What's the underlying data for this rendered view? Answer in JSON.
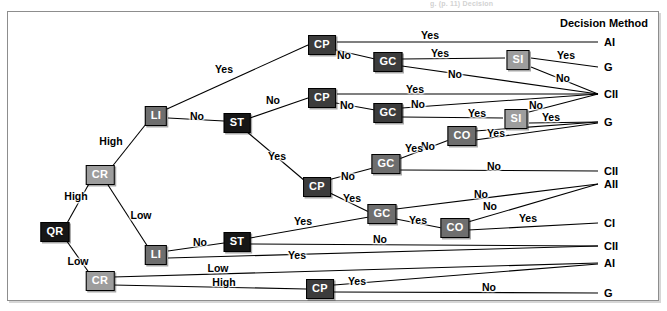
{
  "figure": {
    "cutoff_caption": "g. (p. 11) Decision",
    "header": {
      "label": "Decision Method",
      "x": 648,
      "y": 23
    },
    "frame": {
      "x": 7,
      "y": 11,
      "width": 650,
      "height": 288
    }
  },
  "palette": {
    "black": "#161616",
    "dark_gray": "#3c3c3c",
    "mid_gray": "#6e6e6e",
    "light_gray": "#9d9d9d",
    "line": "#000000",
    "background": "#ffffff",
    "frame_border": "#8d8d8d"
  },
  "nodes": [
    {
      "id": "QR",
      "label": "QR",
      "x": 55,
      "y": 232,
      "shade": "black"
    },
    {
      "id": "CR1",
      "label": "CR",
      "x": 100,
      "y": 175,
      "shade": "light_gray"
    },
    {
      "id": "CR2",
      "label": "CR",
      "x": 100,
      "y": 281,
      "shade": "light_gray"
    },
    {
      "id": "LI1",
      "label": "LI",
      "x": 156,
      "y": 116,
      "shade": "mid_gray"
    },
    {
      "id": "LI2",
      "label": "LI",
      "x": 156,
      "y": 255,
      "shade": "mid_gray"
    },
    {
      "id": "ST1",
      "label": "ST",
      "x": 237,
      "y": 123,
      "shade": "black"
    },
    {
      "id": "ST2",
      "label": "ST",
      "x": 237,
      "y": 242,
      "shade": "black"
    },
    {
      "id": "CP1",
      "label": "CP",
      "x": 322,
      "y": 45,
      "shade": "dark_gray"
    },
    {
      "id": "CP2",
      "label": "CP",
      "x": 322,
      "y": 98,
      "shade": "dark_gray"
    },
    {
      "id": "CP3",
      "label": "CP",
      "x": 317,
      "y": 187,
      "shade": "dark_gray"
    },
    {
      "id": "CP4",
      "label": "CP",
      "x": 320,
      "y": 289,
      "shade": "dark_gray"
    },
    {
      "id": "GC1",
      "label": "GC",
      "x": 388,
      "y": 62,
      "shade": "dark_gray"
    },
    {
      "id": "GC2",
      "label": "GC",
      "x": 388,
      "y": 113,
      "shade": "dark_gray"
    },
    {
      "id": "GC3",
      "label": "GC",
      "x": 386,
      "y": 164,
      "shade": "mid_gray"
    },
    {
      "id": "GC4",
      "label": "GC",
      "x": 382,
      "y": 214,
      "shade": "mid_gray"
    },
    {
      "id": "SI1",
      "label": "SI",
      "x": 518,
      "y": 60,
      "shade": "light_gray"
    },
    {
      "id": "SI2",
      "label": "SI",
      "x": 516,
      "y": 119,
      "shade": "light_gray"
    },
    {
      "id": "CO1",
      "label": "CO",
      "x": 462,
      "y": 136,
      "shade": "mid_gray"
    },
    {
      "id": "CO2",
      "label": "CO",
      "x": 455,
      "y": 228,
      "shade": "mid_gray"
    }
  ],
  "outcomes": [
    {
      "id": "o1",
      "label": "AI",
      "x": 604,
      "y": 42
    },
    {
      "id": "o2",
      "label": "G",
      "x": 604,
      "y": 67
    },
    {
      "id": "o3",
      "label": "CII",
      "x": 604,
      "y": 94
    },
    {
      "id": "o4",
      "label": "G",
      "x": 604,
      "y": 122
    },
    {
      "id": "o5",
      "label": "CII",
      "x": 604,
      "y": 171
    },
    {
      "id": "o6",
      "label": "AII",
      "x": 604,
      "y": 184
    },
    {
      "id": "o7",
      "label": "CI",
      "x": 604,
      "y": 223
    },
    {
      "id": "o8",
      "label": "CII",
      "x": 604,
      "y": 246
    },
    {
      "id": "o9",
      "label": "AI",
      "x": 604,
      "y": 263
    },
    {
      "id": "o10",
      "label": "G",
      "x": 604,
      "y": 293
    }
  ],
  "edges": [
    {
      "from": "QR",
      "to": "CR1",
      "x1": 66,
      "y1": 225,
      "x2": 90,
      "y2": 182
    },
    {
      "from": "QR",
      "to": "CR2",
      "x1": 66,
      "y1": 240,
      "x2": 90,
      "y2": 274
    },
    {
      "from": "CR1",
      "to": "LI1",
      "x1": 111,
      "y1": 168,
      "x2": 146,
      "y2": 124
    },
    {
      "from": "CR1",
      "to": "LI2",
      "x1": 108,
      "y1": 185,
      "x2": 148,
      "y2": 247
    },
    {
      "from": "LI1",
      "to": "CP1",
      "x1": 167,
      "y1": 109,
      "x2": 308,
      "y2": 45
    },
    {
      "from": "LI1",
      "to": "ST1",
      "x1": 168,
      "y1": 118,
      "x2": 224,
      "y2": 121
    },
    {
      "from": "ST1",
      "to": "CP2",
      "x1": 250,
      "y1": 118,
      "x2": 308,
      "y2": 98
    },
    {
      "from": "ST1",
      "to": "CP3",
      "x1": 246,
      "y1": 131,
      "x2": 305,
      "y2": 181
    },
    {
      "from": "CP1",
      "to": "o1",
      "x1": 337,
      "y1": 42,
      "x2": 598,
      "y2": 42
    },
    {
      "from": "CP1",
      "to": "GC1",
      "x1": 336,
      "y1": 50,
      "x2": 375,
      "y2": 59
    },
    {
      "from": "GC1",
      "to": "SI1",
      "x1": 402,
      "y1": 59,
      "x2": 505,
      "y2": 58
    },
    {
      "from": "GC1",
      "to": "o3",
      "x1": 402,
      "y1": 66,
      "x2": 598,
      "y2": 94
    },
    {
      "from": "SI1",
      "to": "o2",
      "x1": 531,
      "y1": 58,
      "x2": 598,
      "y2": 67
    },
    {
      "from": "SI1",
      "to": "o3",
      "x1": 531,
      "y1": 67,
      "x2": 598,
      "y2": 94
    },
    {
      "from": "CP2",
      "to": "o3",
      "x1": 337,
      "y1": 94,
      "x2": 598,
      "y2": 94
    },
    {
      "from": "CP2",
      "to": "GC2",
      "x1": 336,
      "y1": 103,
      "x2": 375,
      "y2": 110
    },
    {
      "from": "GC2",
      "to": "o3",
      "x1": 402,
      "y1": 108,
      "x2": 598,
      "y2": 94
    },
    {
      "from": "GC2",
      "to": "SI2",
      "x1": 402,
      "y1": 117,
      "x2": 503,
      "y2": 118
    },
    {
      "from": "SI2",
      "to": "o3",
      "x1": 529,
      "y1": 112,
      "x2": 598,
      "y2": 94
    },
    {
      "from": "SI2",
      "to": "o4",
      "x1": 529,
      "y1": 123,
      "x2": 598,
      "y2": 122
    },
    {
      "from": "CP3",
      "to": "GC3",
      "x1": 328,
      "y1": 180,
      "x2": 373,
      "y2": 168
    },
    {
      "from": "CP3",
      "to": "GC4",
      "x1": 330,
      "y1": 193,
      "x2": 369,
      "y2": 212
    },
    {
      "from": "GC3",
      "to": "CO1",
      "x1": 399,
      "y1": 159,
      "x2": 449,
      "y2": 140
    },
    {
      "from": "GC3",
      "to": "o5",
      "x1": 400,
      "y1": 170,
      "x2": 598,
      "y2": 171
    },
    {
      "from": "CO1",
      "to": "o4",
      "x1": 475,
      "y1": 131,
      "x2": 598,
      "y2": 122
    },
    {
      "from": "CO1",
      "to": "o4b",
      "x1": 475,
      "y1": 140,
      "x2": 598,
      "y2": 123
    },
    {
      "from": "GC4",
      "to": "o6",
      "x1": 396,
      "y1": 209,
      "x2": 598,
      "y2": 184
    },
    {
      "from": "GC4",
      "to": "CO2",
      "x1": 396,
      "y1": 219,
      "x2": 442,
      "y2": 228
    },
    {
      "from": "CO2",
      "to": "o6",
      "x1": 468,
      "y1": 222,
      "x2": 598,
      "y2": 184
    },
    {
      "from": "CO2",
      "to": "o7",
      "x1": 468,
      "y1": 230,
      "x2": 598,
      "y2": 223
    },
    {
      "from": "LI2",
      "to": "ST2",
      "x1": 168,
      "y1": 251,
      "x2": 224,
      "y2": 243
    },
    {
      "from": "LI2",
      "to": "o8",
      "x1": 168,
      "y1": 258,
      "x2": 598,
      "y2": 246
    },
    {
      "from": "ST2",
      "to": "GC4",
      "x1": 250,
      "y1": 238,
      "x2": 369,
      "y2": 217
    },
    {
      "from": "ST2",
      "to": "o8",
      "x1": 250,
      "y1": 244,
      "x2": 598,
      "y2": 246
    },
    {
      "from": "CR2",
      "to": "o9",
      "x1": 113,
      "y1": 277,
      "x2": 598,
      "y2": 263
    },
    {
      "from": "CR2",
      "to": "CP4",
      "x1": 113,
      "y1": 285,
      "x2": 306,
      "y2": 289
    },
    {
      "from": "CP4",
      "to": "o9",
      "x1": 334,
      "y1": 285,
      "x2": 598,
      "y2": 264
    },
    {
      "from": "CP4",
      "to": "o10",
      "x1": 334,
      "y1": 292,
      "x2": 598,
      "y2": 293
    }
  ],
  "edge_labels": [
    {
      "text": "High",
      "x": 76,
      "y": 196
    },
    {
      "text": "Low",
      "x": 78,
      "y": 261
    },
    {
      "text": "High",
      "x": 111,
      "y": 141
    },
    {
      "text": "Low",
      "x": 141,
      "y": 215
    },
    {
      "text": "Yes",
      "x": 224,
      "y": 69
    },
    {
      "text": "No",
      "x": 197,
      "y": 116
    },
    {
      "text": "No",
      "x": 273,
      "y": 100
    },
    {
      "text": "Yes",
      "x": 277,
      "y": 156
    },
    {
      "text": "Yes",
      "x": 430,
      "y": 35
    },
    {
      "text": "No",
      "x": 344,
      "y": 55
    },
    {
      "text": "Yes",
      "x": 440,
      "y": 53
    },
    {
      "text": "No",
      "x": 455,
      "y": 74
    },
    {
      "text": "Yes",
      "x": 566,
      "y": 55
    },
    {
      "text": "No",
      "x": 563,
      "y": 78
    },
    {
      "text": "Yes",
      "x": 415,
      "y": 89
    },
    {
      "text": "No",
      "x": 347,
      "y": 105
    },
    {
      "text": "No",
      "x": 418,
      "y": 104
    },
    {
      "text": "Yes",
      "x": 477,
      "y": 113
    },
    {
      "text": "No",
      "x": 536,
      "y": 105
    },
    {
      "text": "Yes",
      "x": 551,
      "y": 117
    },
    {
      "text": "Yes",
      "x": 496,
      "y": 133
    },
    {
      "text": "No",
      "x": 428,
      "y": 146
    },
    {
      "text": "Yes",
      "x": 414,
      "y": 148
    },
    {
      "text": "No",
      "x": 494,
      "y": 166
    },
    {
      "text": "No",
      "x": 348,
      "y": 176
    },
    {
      "text": "Yes",
      "x": 352,
      "y": 198
    },
    {
      "text": "No",
      "x": 481,
      "y": 194
    },
    {
      "text": "No",
      "x": 490,
      "y": 206
    },
    {
      "text": "Yes",
      "x": 418,
      "y": 220
    },
    {
      "text": "Yes",
      "x": 528,
      "y": 218
    },
    {
      "text": "Yes",
      "x": 303,
      "y": 221
    },
    {
      "text": "No",
      "x": 200,
      "y": 242
    },
    {
      "text": "No",
      "x": 380,
      "y": 239
    },
    {
      "text": "Yes",
      "x": 297,
      "y": 255
    },
    {
      "text": "Low",
      "x": 218,
      "y": 268
    },
    {
      "text": "High",
      "x": 224,
      "y": 282
    },
    {
      "text": "Yes",
      "x": 357,
      "y": 281
    },
    {
      "text": "No",
      "x": 489,
      "y": 287
    }
  ]
}
